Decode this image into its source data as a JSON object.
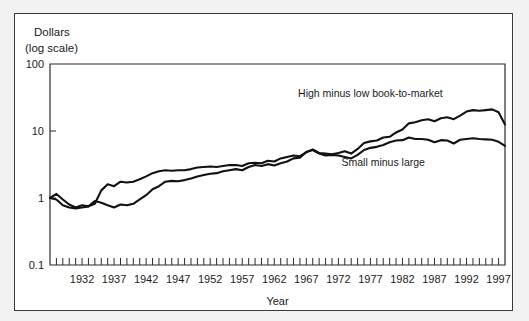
{
  "figure": {
    "background_color": "#f2f2f2",
    "panel_color": "#ffffff",
    "border_color": "#3a3a3a"
  },
  "chart_data": {
    "type": "line",
    "title": "",
    "xlabel": "Year",
    "ylabel": "Dollars (log scale)",
    "ylabel_line1": "Dollars",
    "ylabel_line2": "(log scale)",
    "yscale": "log",
    "ylim": [
      0.1,
      100
    ],
    "ytick_labels": [
      "100",
      "10",
      "1",
      "0.1"
    ],
    "ytick_values": [
      100,
      10,
      1,
      0.1
    ],
    "xlim": [
      1927,
      1998
    ],
    "xtick_labels": [
      "1932",
      "1937",
      "1942",
      "1947",
      "1952",
      "1957",
      "1962",
      "1967",
      "1972",
      "1977",
      "1982",
      "1987",
      "1992",
      "1997"
    ],
    "xtick_values": [
      1932,
      1937,
      1942,
      1947,
      1952,
      1957,
      1962,
      1967,
      1972,
      1977,
      1982,
      1987,
      1992,
      1997
    ],
    "minor_xticks_every": 1,
    "grid": false,
    "legend": "annotations",
    "line_color": "#111111",
    "series": [
      {
        "name": "High minus low book-to-market",
        "annotation": "High minus low book-to-market",
        "annotation_x": 1977,
        "annotation_y": 32,
        "x": [
          1927,
          1928,
          1929,
          1930,
          1931,
          1932,
          1933,
          1934,
          1935,
          1936,
          1937,
          1938,
          1939,
          1940,
          1941,
          1942,
          1943,
          1944,
          1945,
          1946,
          1947,
          1948,
          1949,
          1950,
          1951,
          1952,
          1953,
          1954,
          1955,
          1956,
          1957,
          1958,
          1959,
          1960,
          1961,
          1962,
          1963,
          1964,
          1965,
          1966,
          1967,
          1968,
          1969,
          1970,
          1971,
          1972,
          1973,
          1974,
          1975,
          1976,
          1977,
          1978,
          1979,
          1980,
          1981,
          1982,
          1983,
          1984,
          1985,
          1986,
          1987,
          1988,
          1989,
          1990,
          1991,
          1992,
          1993,
          1994,
          1995,
          1996,
          1997,
          1998
        ],
        "values": [
          1.0,
          1.15,
          0.95,
          0.8,
          0.72,
          0.78,
          0.75,
          0.82,
          1.3,
          1.6,
          1.5,
          1.75,
          1.7,
          1.75,
          1.9,
          2.1,
          2.35,
          2.5,
          2.6,
          2.55,
          2.6,
          2.6,
          2.7,
          2.85,
          2.9,
          2.95,
          2.9,
          3.0,
          3.1,
          3.1,
          3.0,
          3.3,
          3.35,
          3.3,
          3.6,
          3.5,
          3.9,
          4.1,
          4.3,
          4.2,
          4.8,
          5.3,
          4.7,
          4.6,
          4.5,
          4.7,
          5.0,
          4.6,
          5.4,
          6.6,
          7.0,
          7.2,
          8.0,
          8.2,
          9.5,
          10.5,
          13.0,
          13.5,
          14.5,
          15.0,
          14.0,
          15.5,
          16.0,
          15.0,
          17.0,
          19.5,
          20.5,
          20.0,
          20.5,
          21.0,
          19.0,
          12.5
        ]
      },
      {
        "name": "Small minus large",
        "annotation": "Small minus large",
        "annotation_x": 1979,
        "annotation_y": 3.0,
        "x": [
          1927,
          1928,
          1929,
          1930,
          1931,
          1932,
          1933,
          1934,
          1935,
          1936,
          1937,
          1938,
          1939,
          1940,
          1941,
          1942,
          1943,
          1944,
          1945,
          1946,
          1947,
          1948,
          1949,
          1950,
          1951,
          1952,
          1953,
          1954,
          1955,
          1956,
          1957,
          1958,
          1959,
          1960,
          1961,
          1962,
          1963,
          1964,
          1965,
          1966,
          1967,
          1968,
          1969,
          1970,
          1971,
          1972,
          1973,
          1974,
          1975,
          1976,
          1977,
          1978,
          1979,
          1980,
          1981,
          1982,
          1983,
          1984,
          1985,
          1986,
          1987,
          1988,
          1989,
          1990,
          1991,
          1992,
          1993,
          1994,
          1995,
          1996,
          1997,
          1998
        ],
        "values": [
          1.0,
          0.95,
          0.78,
          0.72,
          0.7,
          0.72,
          0.75,
          0.9,
          0.85,
          0.78,
          0.72,
          0.8,
          0.78,
          0.82,
          0.95,
          1.1,
          1.35,
          1.5,
          1.75,
          1.8,
          1.78,
          1.85,
          1.95,
          2.1,
          2.2,
          2.3,
          2.35,
          2.5,
          2.6,
          2.7,
          2.6,
          2.9,
          3.1,
          3.0,
          3.2,
          3.05,
          3.3,
          3.5,
          3.9,
          4.0,
          4.9,
          5.2,
          4.6,
          4.3,
          4.4,
          4.3,
          4.1,
          3.9,
          4.4,
          5.2,
          5.6,
          5.8,
          6.2,
          6.8,
          7.2,
          7.3,
          8.0,
          7.6,
          7.6,
          7.4,
          6.8,
          7.3,
          7.2,
          6.5,
          7.4,
          7.6,
          7.8,
          7.6,
          7.5,
          7.4,
          6.9,
          6.0
        ]
      }
    ]
  }
}
